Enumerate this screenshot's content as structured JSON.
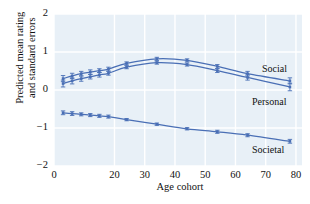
{
  "chart_data": {
    "type": "line",
    "title": "",
    "xlabel": "Age cohort",
    "ylabel": "Predicted mean rating\nand standard errors",
    "xlim": [
      0,
      82
    ],
    "ylim": [
      -2,
      2
    ],
    "xticks": [
      0,
      20,
      30,
      40,
      50,
      60,
      70,
      80
    ],
    "xticklabels": [
      "0",
      "20",
      "30",
      "40",
      "50",
      "60",
      "70",
      "80"
    ],
    "yticks": [
      2,
      1,
      0,
      -1,
      -2
    ],
    "yticklabels": [
      "2",
      "1",
      "0",
      "−1",
      "−2"
    ],
    "grid": true,
    "legend_position": "right-inline",
    "panel_color": "#e8f0f7",
    "grid_color": "#ffffff",
    "line_color": "#4a6fb5",
    "series": [
      {
        "name": "Social",
        "label": "Social",
        "x": [
          3,
          6,
          9,
          12,
          15,
          18,
          24,
          34,
          44,
          54,
          64,
          78
        ],
        "values": [
          0.3,
          0.37,
          0.43,
          0.47,
          0.51,
          0.55,
          0.7,
          0.82,
          0.78,
          0.62,
          0.43,
          0.24
        ],
        "errors": [
          0.08,
          0.07,
          0.06,
          0.06,
          0.05,
          0.05,
          0.04,
          0.04,
          0.04,
          0.05,
          0.06,
          0.08
        ]
      },
      {
        "name": "Personal",
        "label": "Personal",
        "x": [
          3,
          6,
          9,
          12,
          15,
          18,
          24,
          34,
          44,
          54,
          64,
          78
        ],
        "values": [
          0.17,
          0.24,
          0.3,
          0.35,
          0.4,
          0.44,
          0.6,
          0.72,
          0.67,
          0.51,
          0.33,
          0.08
        ],
        "errors": [
          0.09,
          0.08,
          0.07,
          0.06,
          0.06,
          0.05,
          0.04,
          0.04,
          0.04,
          0.05,
          0.07,
          0.1
        ]
      },
      {
        "name": "Societal",
        "label": "Societal",
        "x": [
          3,
          6,
          9,
          12,
          15,
          18,
          24,
          34,
          44,
          54,
          64,
          78
        ],
        "values": [
          -0.6,
          -0.62,
          -0.64,
          -0.66,
          -0.68,
          -0.7,
          -0.78,
          -0.9,
          -1.02,
          -1.1,
          -1.19,
          -1.35
        ],
        "errors": [
          0.05,
          0.05,
          0.04,
          0.04,
          0.04,
          0.04,
          0.03,
          0.03,
          0.03,
          0.04,
          0.04,
          0.05
        ]
      }
    ]
  }
}
